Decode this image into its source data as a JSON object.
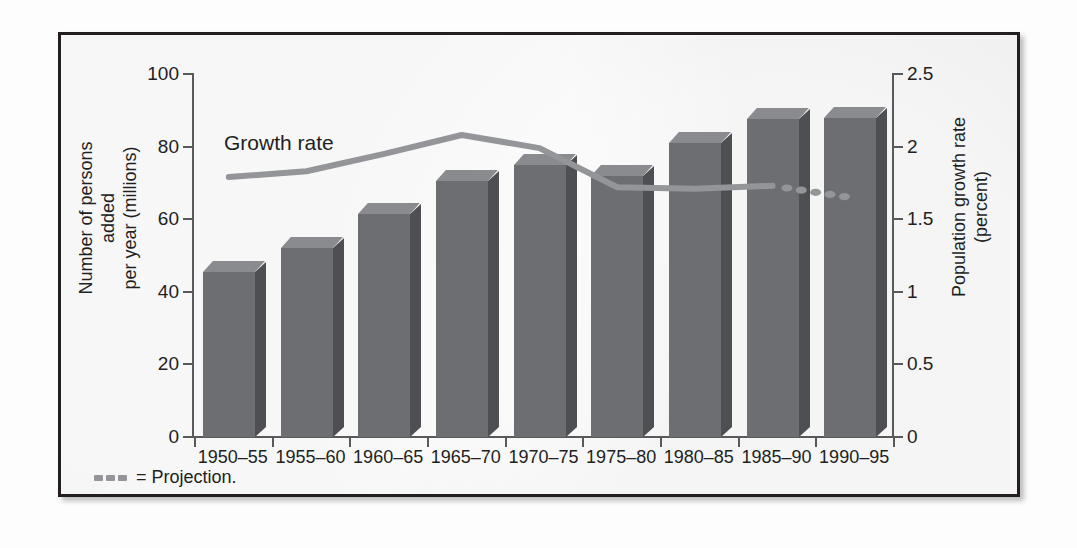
{
  "figure": {
    "series_label": "Growth rate",
    "legend": {
      "marker_icon": "dashed-line-icon",
      "text": "= Projection."
    },
    "left_axis": {
      "title": "Number of persons added\nper year (millions)",
      "ticks": [
        "0",
        "20",
        "40",
        "60",
        "80",
        "100"
      ]
    },
    "right_axis": {
      "title": "Population growth rate\n(percent)",
      "ticks": [
        "0",
        "0.5",
        "1",
        "1.5",
        "2",
        "2.5"
      ]
    }
  },
  "chart_data": {
    "type": "bar",
    "title": "",
    "xlabel": "",
    "ylabel": "Number of persons added per year (millions)",
    "y2label": "Population growth rate (percent)",
    "ylim": [
      0,
      100
    ],
    "y2lim": [
      0,
      2.5
    ],
    "yticks": [
      0,
      20,
      40,
      60,
      80,
      100
    ],
    "y2ticks": [
      0,
      0.5,
      1,
      1.5,
      2,
      2.5
    ],
    "grid": false,
    "legend_position": "bottom-left",
    "categories": [
      "1950–55",
      "1955–60",
      "1960–65",
      "1965–70",
      "1970–75",
      "1975–80",
      "1980–85",
      "1985–90",
      "1990–95"
    ],
    "series": [
      {
        "name": "Number of persons added per year (millions)",
        "type": "bar",
        "axis": "left",
        "color": "#6d6e71",
        "values": [
          45.5,
          52,
          61.5,
          70.5,
          75,
          72,
          81,
          87.5,
          88
        ]
      },
      {
        "name": "Growth rate",
        "type": "line",
        "axis": "right",
        "color": "#939598",
        "values": [
          1.79,
          1.83,
          1.95,
          2.08,
          1.99,
          1.72,
          1.71,
          1.73,
          1.65
        ],
        "projection_from": "1985–90",
        "projection_values": [
          1.73,
          1.65
        ]
      }
    ],
    "annotations": [
      {
        "text": "Growth rate",
        "target": "line-series"
      },
      {
        "text": "= Projection.",
        "target": "legend"
      }
    ]
  }
}
